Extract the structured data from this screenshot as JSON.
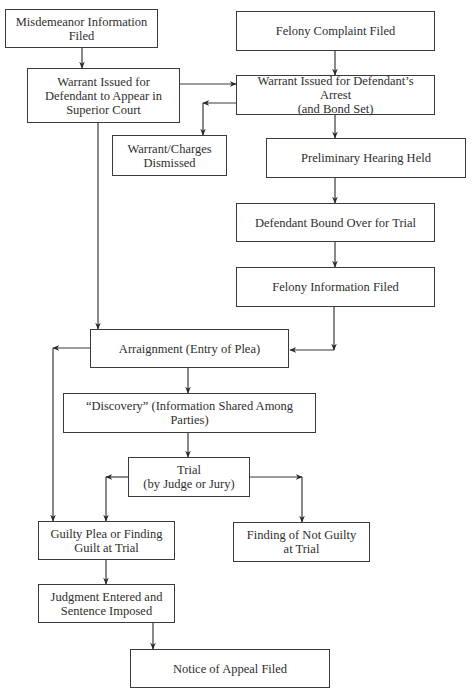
{
  "diagram": {
    "type": "flowchart",
    "nodes": [
      {
        "id": "misdemeanor_info",
        "label": "Misdemeanor Information\nFiled"
      },
      {
        "id": "felony_complaint",
        "label": "Felony Complaint Filed"
      },
      {
        "id": "warrant_superior",
        "label": "Warrant Issued for\nDefendant to Appear in\nSuperior Court"
      },
      {
        "id": "warrant_arrest",
        "label": "Warrant Issued for Defendant’s Arrest\n(and Bond Set)"
      },
      {
        "id": "charges_dismissed",
        "label": "Warrant/Charges\nDismissed"
      },
      {
        "id": "preliminary_hearing",
        "label": "Preliminary Hearing Held"
      },
      {
        "id": "bound_over",
        "label": "Defendant Bound Over for Trial"
      },
      {
        "id": "felony_info",
        "label": "Felony Information Filed"
      },
      {
        "id": "arraignment",
        "label": "Arraignment (Entry of Plea)"
      },
      {
        "id": "discovery",
        "label": "“Discovery” (Information Shared Among Parties)"
      },
      {
        "id": "trial",
        "label": "Trial\n(by Judge or Jury)"
      },
      {
        "id": "guilty",
        "label": "Guilty Plea or Finding\nGuilt at Trial"
      },
      {
        "id": "not_guilty",
        "label": "Finding of Not Guilty\nat Trial"
      },
      {
        "id": "judgment",
        "label": "Judgment Entered and\nSentence Imposed"
      },
      {
        "id": "appeal",
        "label": "Notice of Appeal Filed"
      }
    ],
    "edges": [
      {
        "from": "misdemeanor_info",
        "to": "warrant_superior"
      },
      {
        "from": "felony_complaint",
        "to": "warrant_arrest"
      },
      {
        "from": "warrant_superior",
        "to": "warrant_arrest"
      },
      {
        "from": "warrant_arrest",
        "to": "charges_dismissed"
      },
      {
        "from": "warrant_arrest",
        "to": "preliminary_hearing"
      },
      {
        "from": "preliminary_hearing",
        "to": "bound_over"
      },
      {
        "from": "bound_over",
        "to": "felony_info"
      },
      {
        "from": "warrant_superior",
        "to": "arraignment"
      },
      {
        "from": "felony_info",
        "to": "arraignment"
      },
      {
        "from": "arraignment",
        "to": "discovery"
      },
      {
        "from": "arraignment",
        "to": "guilty"
      },
      {
        "from": "discovery",
        "to": "trial"
      },
      {
        "from": "trial",
        "to": "guilty"
      },
      {
        "from": "trial",
        "to": "not_guilty"
      },
      {
        "from": "guilty",
        "to": "judgment"
      },
      {
        "from": "judgment",
        "to": "appeal"
      }
    ],
    "colors": {
      "line": "#3a3a3a",
      "text": "#2e2e2e",
      "background": "#ffffff"
    }
  }
}
